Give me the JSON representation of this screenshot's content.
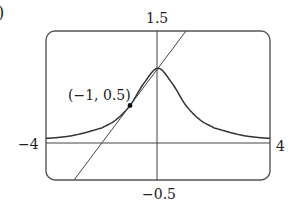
{
  "figure": {
    "corner_label": ")",
    "ymax_label": "1.5",
    "ymin_label": "−0.5",
    "xmin_label": "−4",
    "xmax_label": "4",
    "point_label": "(−1, 0.5)"
  },
  "chart_data": {
    "type": "line",
    "title": "",
    "xlabel": "",
    "ylabel": "",
    "xlim": [
      -4,
      4
    ],
    "ylim": [
      -0.5,
      1.5
    ],
    "grid": false,
    "legend": null,
    "series": [
      {
        "name": "curve y = 1/(1+x^2)",
        "x": [
          -4,
          -3,
          -2,
          -1.5,
          -1,
          -0.5,
          0,
          0.5,
          1,
          1.5,
          2,
          3,
          4
        ],
        "y": [
          0.059,
          0.1,
          0.2,
          0.308,
          0.5,
          0.8,
          1.0,
          0.8,
          0.5,
          0.308,
          0.2,
          0.1,
          0.059
        ]
      },
      {
        "name": "tangent line y = 0.5x + 1",
        "x": [
          -3,
          1
        ],
        "y": [
          -0.5,
          1.5
        ]
      }
    ],
    "annotations": [
      {
        "text": "(−1, 0.5)",
        "x": -1,
        "y": 0.5,
        "marker": "dot"
      }
    ],
    "tick_labels": {
      "x": [
        "−4",
        "4"
      ],
      "y": [
        "−0.5",
        "1.5"
      ]
    }
  },
  "colors": {
    "stroke": "#333333",
    "frame": "#555555",
    "background": "#ffffff"
  }
}
